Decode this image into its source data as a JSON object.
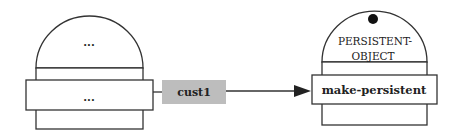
{
  "diagram": {
    "left_object": {
      "state_label": "...",
      "method_label": "..."
    },
    "message": {
      "label": "cust1",
      "fill_color": "#bdbdbd"
    },
    "right_object": {
      "class_name_line1": "PERSISTENT-",
      "class_name_line2": "OBJECT",
      "method_label": "make-persistent"
    },
    "colors": {
      "stroke": "#333333",
      "background": "#ffffff"
    }
  }
}
